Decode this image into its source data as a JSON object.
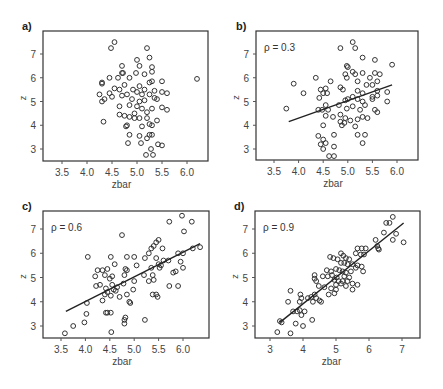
{
  "figure": {
    "panels": [
      {
        "id": "a",
        "label": "a)",
        "rho_label": ""
      },
      {
        "id": "b",
        "label": "b)",
        "rho_label": "ρ = 0.3"
      },
      {
        "id": "c",
        "label": "c)",
        "rho_label": "ρ = 0.6"
      },
      {
        "id": "d",
        "label": "d)",
        "rho_label": "ρ = 0.9"
      }
    ]
  },
  "chart_data": [
    {
      "type": "scatter",
      "panel": "a)",
      "title": "",
      "xlabel": "zbar",
      "ylabel": "z",
      "xticks": [
        "3.5",
        "4.0",
        "4.5",
        "5.0",
        "5.5",
        "6.0"
      ],
      "yticks": [
        "3",
        "4",
        "5",
        "6",
        "7"
      ],
      "xlim": [
        3.2,
        6.5
      ],
      "ylim": [
        2.5,
        7.8
      ],
      "grid": false,
      "regression_line": null,
      "points": [
        [
          4.55,
          7.5
        ],
        [
          4.48,
          7.25
        ],
        [
          5.2,
          7.25
        ],
        [
          5.25,
          6.85
        ],
        [
          5.0,
          6.75
        ],
        [
          4.7,
          6.5
        ],
        [
          5.05,
          6.5
        ],
        [
          5.3,
          6.45
        ],
        [
          4.7,
          6.2
        ],
        [
          4.72,
          6.2
        ],
        [
          5.15,
          6.15
        ],
        [
          4.98,
          6.2
        ],
        [
          5.3,
          6.25
        ],
        [
          4.3,
          5.8
        ],
        [
          4.3,
          5.75
        ],
        [
          4.45,
          6.0
        ],
        [
          4.62,
          6.0
        ],
        [
          5.25,
          5.8
        ],
        [
          5.3,
          5.85
        ],
        [
          4.85,
          6.0
        ],
        [
          5.5,
          5.85
        ],
        [
          6.2,
          5.95
        ],
        [
          4.75,
          5.7
        ],
        [
          5.05,
          5.65
        ],
        [
          4.92,
          5.5
        ],
        [
          4.65,
          5.5
        ],
        [
          4.55,
          5.55
        ],
        [
          5.15,
          5.5
        ],
        [
          5.35,
          5.45
        ],
        [
          4.25,
          5.3
        ],
        [
          4.45,
          5.35
        ],
        [
          4.8,
          5.3
        ],
        [
          5.0,
          5.4
        ],
        [
          5.1,
          5.3
        ],
        [
          5.25,
          5.3
        ],
        [
          5.5,
          5.4
        ],
        [
          5.6,
          5.35
        ],
        [
          4.3,
          5.0
        ],
        [
          4.35,
          5.1
        ],
        [
          4.5,
          5.2
        ],
        [
          4.7,
          5.25
        ],
        [
          4.9,
          5.1
        ],
        [
          5.05,
          5.0
        ],
        [
          5.15,
          5.05
        ],
        [
          5.35,
          5.15
        ],
        [
          5.4,
          5.1
        ],
        [
          4.65,
          4.8
        ],
        [
          4.85,
          4.85
        ],
        [
          5.0,
          4.8
        ],
        [
          5.1,
          4.7
        ],
        [
          5.3,
          4.7
        ],
        [
          5.5,
          4.75
        ],
        [
          5.6,
          4.65
        ],
        [
          4.95,
          4.5
        ],
        [
          5.2,
          4.55
        ],
        [
          4.65,
          4.45
        ],
        [
          4.75,
          4.4
        ],
        [
          4.85,
          4.35
        ],
        [
          4.95,
          4.3
        ],
        [
          5.05,
          4.3
        ],
        [
          5.2,
          4.3
        ],
        [
          5.4,
          4.2
        ],
        [
          4.33,
          4.15
        ],
        [
          4.8,
          4.0
        ],
        [
          4.78,
          3.95
        ],
        [
          5.1,
          3.95
        ],
        [
          5.25,
          4.05
        ],
        [
          5.3,
          4.0
        ],
        [
          4.85,
          3.6
        ],
        [
          5.05,
          3.55
        ],
        [
          5.25,
          3.6
        ],
        [
          5.3,
          3.6
        ],
        [
          5.2,
          3.45
        ],
        [
          4.82,
          3.25
        ],
        [
          5.08,
          3.25
        ],
        [
          5.42,
          3.2
        ],
        [
          5.5,
          3.15
        ],
        [
          5.28,
          3.0
        ],
        [
          5.18,
          2.75
        ],
        [
          5.32,
          2.75
        ]
      ]
    },
    {
      "type": "scatter",
      "panel": "b)",
      "annotation": "ρ = 0.3",
      "xlabel": "zbar",
      "ylabel": "z",
      "xticks": [
        "3.5",
        "4.0",
        "4.5",
        "5.0",
        "5.5",
        "6.0"
      ],
      "yticks": [
        "3",
        "4",
        "5",
        "6",
        "7"
      ],
      "xlim": [
        3.2,
        6.5
      ],
      "ylim": [
        2.5,
        7.8
      ],
      "grid": false,
      "regression_line": {
        "x": [
          3.8,
          5.9
        ],
        "y": [
          4.15,
          5.7
        ]
      },
      "points": [
        [
          5.1,
          7.5
        ],
        [
          4.85,
          7.25
        ],
        [
          5.15,
          7.25
        ],
        [
          5.3,
          6.85
        ],
        [
          5.55,
          6.75
        ],
        [
          5.9,
          6.55
        ],
        [
          4.98,
          6.5
        ],
        [
          5.0,
          6.45
        ],
        [
          5.1,
          6.25
        ],
        [
          4.95,
          6.15
        ],
        [
          5.15,
          6.15
        ],
        [
          5.3,
          6.2
        ],
        [
          5.55,
          6.2
        ],
        [
          5.65,
          6.15
        ],
        [
          4.35,
          6.0
        ],
        [
          4.98,
          6.0
        ],
        [
          5.45,
          6.0
        ],
        [
          4.65,
          5.85
        ],
        [
          5.2,
          5.85
        ],
        [
          5.6,
          5.85
        ],
        [
          3.9,
          5.75
        ],
        [
          5.38,
          5.7
        ],
        [
          5.5,
          5.7
        ],
        [
          4.85,
          5.6
        ],
        [
          4.45,
          5.5
        ],
        [
          4.55,
          5.55
        ],
        [
          4.9,
          5.5
        ],
        [
          5.2,
          5.45
        ],
        [
          5.6,
          5.45
        ],
        [
          4.1,
          5.35
        ],
        [
          4.5,
          5.35
        ],
        [
          4.58,
          5.35
        ],
        [
          5.3,
          5.35
        ],
        [
          5.8,
          5.4
        ],
        [
          5.1,
          5.2
        ],
        [
          5.5,
          5.2
        ],
        [
          5.6,
          5.25
        ],
        [
          4.42,
          5.15
        ],
        [
          4.95,
          5.05
        ],
        [
          5.0,
          5.1
        ],
        [
          5.2,
          5.1
        ],
        [
          5.3,
          5.0
        ],
        [
          5.5,
          5.1
        ],
        [
          5.8,
          5.0
        ],
        [
          4.55,
          4.85
        ],
        [
          4.82,
          4.85
        ],
        [
          5.1,
          4.8
        ],
        [
          5.35,
          4.85
        ],
        [
          3.75,
          4.7
        ],
        [
          4.4,
          4.65
        ],
        [
          4.48,
          4.65
        ],
        [
          4.6,
          4.65
        ],
        [
          4.98,
          4.7
        ],
        [
          5.25,
          4.65
        ],
        [
          5.55,
          4.65
        ],
        [
          5.6,
          4.55
        ],
        [
          4.55,
          4.4
        ],
        [
          4.7,
          4.35
        ],
        [
          4.85,
          4.45
        ],
        [
          4.95,
          4.3
        ],
        [
          5.3,
          4.35
        ],
        [
          5.4,
          4.3
        ],
        [
          4.85,
          4.15
        ],
        [
          4.93,
          4.1
        ],
        [
          5.05,
          4.2
        ],
        [
          5.2,
          4.25
        ],
        [
          4.5,
          4.0
        ],
        [
          4.88,
          4.0
        ],
        [
          5.15,
          3.95
        ],
        [
          4.4,
          3.55
        ],
        [
          4.72,
          3.6
        ],
        [
          5.2,
          3.6
        ],
        [
          5.35,
          3.6
        ],
        [
          4.5,
          3.4
        ],
        [
          4.55,
          3.25
        ],
        [
          4.45,
          3.2
        ],
        [
          4.72,
          3.1
        ],
        [
          5.3,
          3.25
        ],
        [
          4.5,
          3.0
        ],
        [
          4.62,
          2.7
        ],
        [
          4.72,
          2.7
        ]
      ]
    },
    {
      "type": "scatter",
      "panel": "c)",
      "annotation": "ρ = 0.6",
      "xlabel": "zbar",
      "ylabel": "z",
      "xticks": [
        "3.5",
        "4.0",
        "4.5",
        "5.0",
        "5.5",
        "6.0"
      ],
      "yticks": [
        "3",
        "4",
        "5",
        "6",
        "7"
      ],
      "xlim": [
        3.2,
        6.5
      ],
      "ylim": [
        2.5,
        7.8
      ],
      "grid": false,
      "regression_line": {
        "x": [
          3.6,
          6.35
        ],
        "y": [
          3.6,
          6.4
        ]
      },
      "points": [
        [
          5.98,
          7.55
        ],
        [
          5.72,
          7.3
        ],
        [
          6.18,
          7.3
        ],
        [
          6.02,
          6.9
        ],
        [
          4.75,
          6.75
        ],
        [
          5.5,
          6.55
        ],
        [
          5.45,
          6.45
        ],
        [
          5.4,
          6.3
        ],
        [
          5.35,
          6.2
        ],
        [
          5.58,
          6.2
        ],
        [
          6.2,
          6.2
        ],
        [
          6.35,
          6.25
        ],
        [
          5.9,
          6.0
        ],
        [
          6.0,
          6.0
        ],
        [
          5.3,
          6.0
        ],
        [
          4.05,
          5.85
        ],
        [
          4.52,
          5.85
        ],
        [
          4.85,
          5.85
        ],
        [
          5.0,
          5.85
        ],
        [
          5.22,
          5.8
        ],
        [
          5.45,
          5.8
        ],
        [
          5.6,
          5.7
        ],
        [
          5.7,
          5.7
        ],
        [
          5.95,
          5.65
        ],
        [
          4.6,
          5.55
        ],
        [
          5.05,
          5.5
        ],
        [
          5.5,
          5.55
        ],
        [
          5.55,
          5.5
        ],
        [
          6.0,
          5.4
        ],
        [
          4.25,
          5.3
        ],
        [
          4.35,
          5.3
        ],
        [
          4.45,
          5.35
        ],
        [
          4.82,
          5.35
        ],
        [
          4.85,
          5.3
        ],
        [
          5.35,
          5.4
        ],
        [
          5.52,
          5.4
        ],
        [
          4.2,
          5.05
        ],
        [
          4.4,
          5.1
        ],
        [
          4.55,
          5.05
        ],
        [
          4.8,
          5.1
        ],
        [
          5.2,
          5.1
        ],
        [
          5.38,
          5.1
        ],
        [
          5.8,
          5.2
        ],
        [
          5.85,
          5.25
        ],
        [
          4.5,
          4.95
        ],
        [
          5.0,
          4.85
        ],
        [
          5.3,
          4.85
        ],
        [
          5.4,
          4.9
        ],
        [
          4.22,
          4.65
        ],
        [
          4.3,
          4.7
        ],
        [
          4.42,
          4.55
        ],
        [
          4.55,
          4.7
        ],
        [
          4.65,
          4.6
        ],
        [
          4.78,
          4.75
        ],
        [
          5.72,
          4.65
        ],
        [
          5.9,
          4.65
        ],
        [
          4.45,
          4.4
        ],
        [
          4.58,
          4.5
        ],
        [
          4.62,
          4.45
        ],
        [
          4.98,
          4.5
        ],
        [
          4.4,
          4.3
        ],
        [
          4.52,
          4.25
        ],
        [
          4.7,
          4.2
        ],
        [
          4.85,
          4.3
        ],
        [
          5.38,
          4.3
        ],
        [
          5.45,
          4.3
        ],
        [
          5.48,
          4.2
        ],
        [
          4.35,
          4.05
        ],
        [
          4.9,
          4.0
        ],
        [
          4.92,
          3.95
        ],
        [
          4.03,
          3.95
        ],
        [
          4.02,
          3.5
        ],
        [
          4.45,
          3.55
        ],
        [
          4.52,
          3.55
        ],
        [
          4.42,
          3.55
        ],
        [
          4.82,
          3.35
        ],
        [
          4.8,
          3.25
        ],
        [
          5.22,
          3.25
        ],
        [
          4.8,
          3.1
        ],
        [
          3.75,
          3.0
        ],
        [
          3.98,
          3.15
        ],
        [
          3.58,
          2.7
        ],
        [
          4.53,
          2.75
        ]
      ]
    },
    {
      "type": "scatter",
      "panel": "d)",
      "annotation": "ρ = 0.9",
      "xlabel": "zbar",
      "ylabel": "z",
      "xticks": [
        "3",
        "4",
        "5",
        "6",
        "7"
      ],
      "yticks": [
        "3",
        "4",
        "5",
        "6",
        "7"
      ],
      "xlim": [
        2.6,
        7.55
      ],
      "ylim": [
        2.5,
        7.8
      ],
      "grid": false,
      "regression_line": {
        "x": [
          3.3,
          7.05
        ],
        "y": [
          3.15,
          7.25
        ]
      },
      "points": [
        [
          6.72,
          7.5
        ],
        [
          6.52,
          7.25
        ],
        [
          6.62,
          7.25
        ],
        [
          6.45,
          6.85
        ],
        [
          6.82,
          6.8
        ],
        [
          6.72,
          6.55
        ],
        [
          7.05,
          6.45
        ],
        [
          6.2,
          6.55
        ],
        [
          6.25,
          6.3
        ],
        [
          6.28,
          6.2
        ],
        [
          6.3,
          6.15
        ],
        [
          5.65,
          6.2
        ],
        [
          5.78,
          6.2
        ],
        [
          5.9,
          6.2
        ],
        [
          5.6,
          6.0
        ],
        [
          5.75,
          5.95
        ],
        [
          5.85,
          5.95
        ],
        [
          5.15,
          6.0
        ],
        [
          5.22,
          5.9
        ],
        [
          4.82,
          5.85
        ],
        [
          4.92,
          5.8
        ],
        [
          5.05,
          5.75
        ],
        [
          5.3,
          5.8
        ],
        [
          5.4,
          5.75
        ],
        [
          5.15,
          5.6
        ],
        [
          5.25,
          5.6
        ],
        [
          5.35,
          5.55
        ],
        [
          5.5,
          5.55
        ],
        [
          5.65,
          5.5
        ],
        [
          5.78,
          5.45
        ],
        [
          4.72,
          5.3
        ],
        [
          4.85,
          5.25
        ],
        [
          5.0,
          5.35
        ],
        [
          5.1,
          5.3
        ],
        [
          5.2,
          5.25
        ],
        [
          5.3,
          5.2
        ],
        [
          5.45,
          5.25
        ],
        [
          5.6,
          5.4
        ],
        [
          5.82,
          5.25
        ],
        [
          4.35,
          5.1
        ],
        [
          4.6,
          5.05
        ],
        [
          4.75,
          5.05
        ],
        [
          4.88,
          5.1
        ],
        [
          5.02,
          5.0
        ],
        [
          5.25,
          5.05
        ],
        [
          5.4,
          5.0
        ],
        [
          4.35,
          4.95
        ],
        [
          4.4,
          4.85
        ],
        [
          4.95,
          4.9
        ],
        [
          5.08,
          4.85
        ],
        [
          5.2,
          4.85
        ],
        [
          5.35,
          4.85
        ],
        [
          5.5,
          4.75
        ],
        [
          5.65,
          4.7
        ],
        [
          4.48,
          4.65
        ],
        [
          4.65,
          4.6
        ],
        [
          5.0,
          4.7
        ],
        [
          5.15,
          4.75
        ],
        [
          5.3,
          4.65
        ],
        [
          5.5,
          4.5
        ],
        [
          4.85,
          4.55
        ],
        [
          5.0,
          4.5
        ],
        [
          4.78,
          4.3
        ],
        [
          4.95,
          4.35
        ],
        [
          4.25,
          4.2
        ],
        [
          4.35,
          4.3
        ],
        [
          4.4,
          4.15
        ],
        [
          4.5,
          4.05
        ],
        [
          3.62,
          4.45
        ],
        [
          3.92,
          4.3
        ],
        [
          3.55,
          4.0
        ],
        [
          3.95,
          4.15
        ],
        [
          4.15,
          4.15
        ],
        [
          4.3,
          4.0
        ],
        [
          4.55,
          4.0
        ],
        [
          3.9,
          4.0
        ],
        [
          3.7,
          3.6
        ],
        [
          3.82,
          3.6
        ],
        [
          3.9,
          3.65
        ],
        [
          4.05,
          3.6
        ],
        [
          3.95,
          3.45
        ],
        [
          3.3,
          3.2
        ],
        [
          3.35,
          3.15
        ],
        [
          3.78,
          3.1
        ],
        [
          4.0,
          3.0
        ],
        [
          4.28,
          3.25
        ],
        [
          3.22,
          2.75
        ],
        [
          3.62,
          2.7
        ]
      ]
    }
  ]
}
